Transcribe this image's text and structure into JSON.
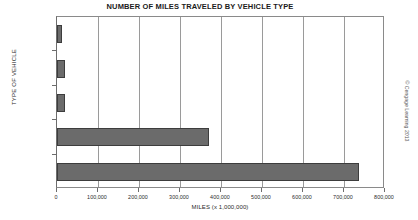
{
  "chart_data": {
    "type": "bar",
    "orientation": "horizontal",
    "title": "NUMBER OF MILES TRAVELED BY VEHICLE TYPE",
    "xlabel": "MILES (x 1,000,000)",
    "ylabel": "TYPE OF VEHICLE",
    "categories": [
      "SHIP",
      "TRAIN",
      "BUS",
      "AIRPLANE",
      "PERSONAL"
    ],
    "values": [
      11000,
      19000,
      20000,
      370000,
      737000
    ],
    "xlim": [
      0,
      800000
    ],
    "xticks": [
      0,
      100000,
      200000,
      300000,
      400000,
      500000,
      600000,
      700000,
      800000
    ],
    "xtick_labels": [
      "0",
      "100,000",
      "200,000",
      "300,000",
      "400,000",
      "500,000",
      "600,000",
      "700,000",
      "800,000"
    ],
    "grid": "vertical",
    "legend": null,
    "bar_color": "#6b6b6b",
    "bar_edge_color": "#3d3d3d",
    "frame_color": "#8a8a8a"
  },
  "credit": "© Cengage Learning 2013"
}
